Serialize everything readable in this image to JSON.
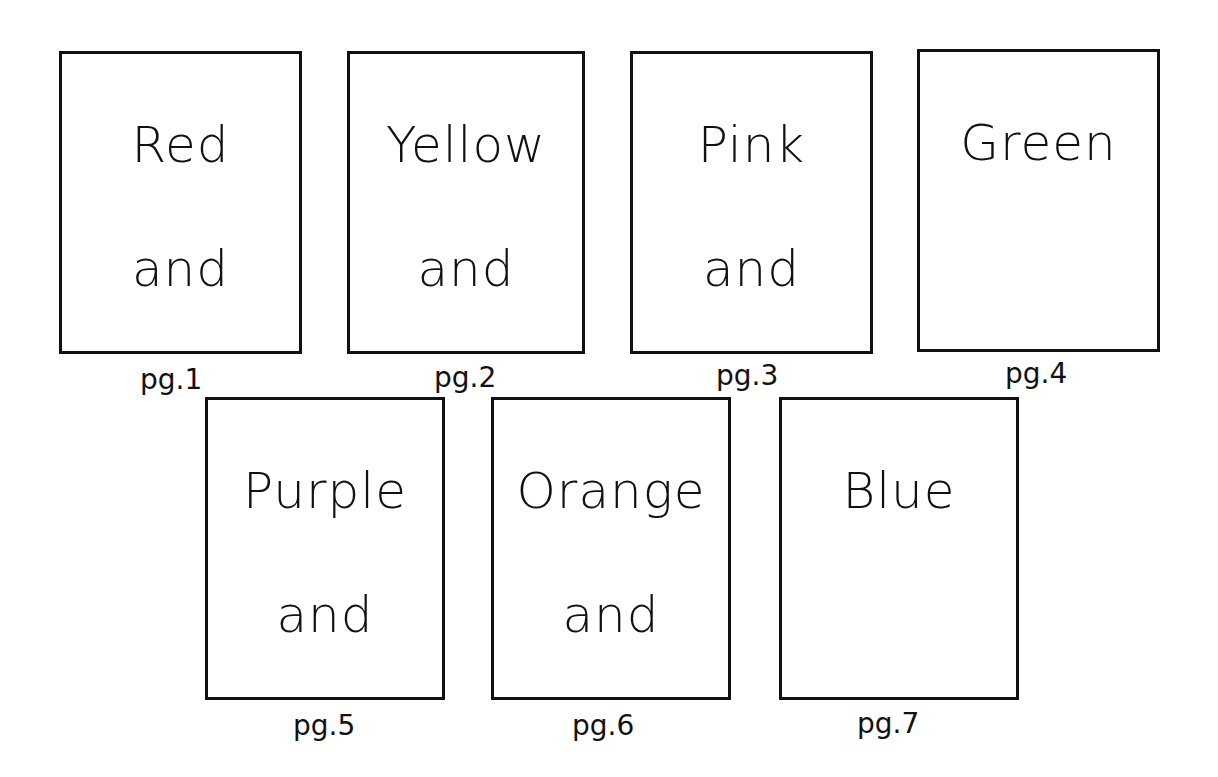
{
  "pages": [
    {
      "number": "pg.1",
      "line1": "Red",
      "line2": "and"
    },
    {
      "number": "pg.2",
      "line1": "Yellow",
      "line2": "and"
    },
    {
      "number": "pg.3",
      "line1": "Pink",
      "line2": "and"
    },
    {
      "number": "pg.4",
      "line1": "Green",
      "line2": ""
    },
    {
      "number": "pg.5",
      "line1": "Purple",
      "line2": "and"
    },
    {
      "number": "pg.6",
      "line1": "Orange",
      "line2": "and"
    },
    {
      "number": "pg.7",
      "line1": "Blue",
      "line2": ""
    }
  ],
  "colors": {
    "ink": "#111111",
    "paper": "#ffffff"
  }
}
